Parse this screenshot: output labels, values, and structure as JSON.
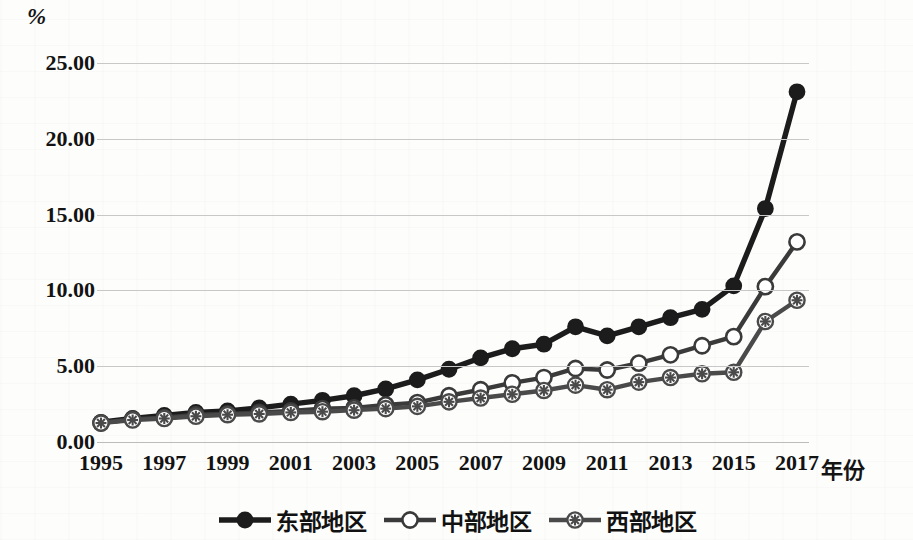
{
  "chart_data": {
    "type": "line",
    "title": "",
    "subtitle": "",
    "xlabel": "年份",
    "ylabel": "%",
    "y_unit_label": "%",
    "grid": true,
    "legend_position": "bottom",
    "xlim": [
      1995,
      2017
    ],
    "ylim": [
      0.0,
      25.0
    ],
    "ytick_labels": [
      "0.00",
      "5.00",
      "10.00",
      "15.00",
      "20.00",
      "25.00"
    ],
    "ytick_values": [
      0,
      5,
      10,
      15,
      20,
      25
    ],
    "x": [
      1995,
      1996,
      1997,
      1998,
      1999,
      2000,
      2001,
      2002,
      2003,
      2004,
      2005,
      2006,
      2007,
      2008,
      2009,
      2010,
      2011,
      2012,
      2013,
      2014,
      2015,
      2016,
      2017
    ],
    "xtick_labels": [
      "1995",
      "1997",
      "1999",
      "2001",
      "2003",
      "2005",
      "2007",
      "2009",
      "2011",
      "2013",
      "2015",
      "2017"
    ],
    "xtick_values": [
      1995,
      1997,
      1999,
      2001,
      2003,
      2005,
      2007,
      2009,
      2011,
      2013,
      2015,
      2017
    ],
    "series": [
      {
        "name": "东部地区",
        "marker": "filled-circle",
        "color": "#1c1c1c",
        "values": [
          1.3,
          1.55,
          1.75,
          1.95,
          2.05,
          2.25,
          2.5,
          2.75,
          3.05,
          3.5,
          4.1,
          4.8,
          5.55,
          6.15,
          6.45,
          7.6,
          7.0,
          7.6,
          8.2,
          8.75,
          10.3,
          15.4,
          23.1
        ]
      },
      {
        "name": "中部地区",
        "marker": "open-circle",
        "color": "#3a3a3a",
        "values": [
          1.25,
          1.5,
          1.6,
          1.8,
          1.85,
          1.95,
          2.05,
          2.2,
          2.25,
          2.45,
          2.6,
          3.05,
          3.45,
          3.9,
          4.25,
          4.85,
          4.75,
          5.2,
          5.75,
          6.35,
          6.95,
          10.25,
          13.2
        ]
      },
      {
        "name": "西部地区",
        "marker": "crossed-circle",
        "color": "#4a4a4a",
        "values": [
          1.25,
          1.45,
          1.55,
          1.7,
          1.8,
          1.85,
          1.95,
          2.0,
          2.1,
          2.2,
          2.35,
          2.65,
          2.9,
          3.15,
          3.4,
          3.75,
          3.45,
          3.95,
          4.25,
          4.5,
          4.6,
          7.95,
          9.35
        ]
      }
    ]
  },
  "legend": {
    "items": [
      {
        "label": "东部地区",
        "marker": "filled-circle"
      },
      {
        "label": "中部地区",
        "marker": "open-circle"
      },
      {
        "label": "西部地区",
        "marker": "crossed-circle"
      }
    ]
  }
}
